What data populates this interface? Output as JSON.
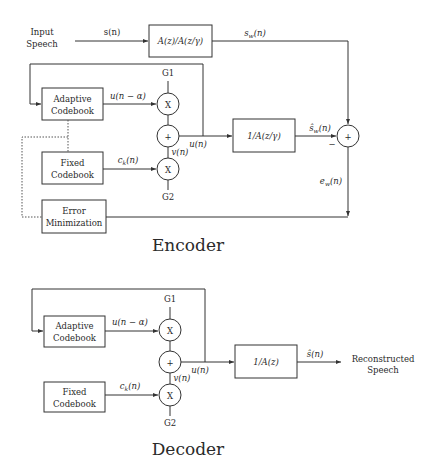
{
  "encoder": {
    "title": "Encoder",
    "input_label_line1": "Input",
    "input_label_line2": "Speech",
    "signal_s": "s(n)",
    "weighting_filter": "A(z)/A(z/γ)",
    "signal_sw": "s_w(n)",
    "adaptive_codebook_line1": "Adaptive",
    "adaptive_codebook_line2": "Codebook",
    "fixed_codebook_line1": "Fixed",
    "fixed_codebook_line2": "Codebook",
    "error_min_line1": "Error",
    "error_min_line2": "Minimization",
    "signal_u_alpha": "u(n − α)",
    "signal_ck": "c_k(n)",
    "signal_u": "u(n)",
    "signal_v": "v(n)",
    "gain1": "G1",
    "gain2": "G2",
    "multiply_symbol": "X",
    "add_symbol": "+",
    "synthesis_filter": "1/A(z/γ)",
    "signal_sw_hat": "ŝ_w(n)",
    "minus_sign": "−",
    "signal_ew": "e_w(n)"
  },
  "decoder": {
    "title": "Decoder",
    "adaptive_codebook_line1": "Adaptive",
    "adaptive_codebook_line2": "Codebook",
    "fixed_codebook_line1": "Fixed",
    "fixed_codebook_line2": "Codebook",
    "signal_u_alpha": "u(n − α)",
    "signal_ck": "c_k(n)",
    "signal_u": "u(n)",
    "signal_v": "v(n)",
    "gain1": "G1",
    "gain2": "G2",
    "multiply_symbol": "X",
    "add_symbol": "+",
    "synthesis_filter": "1/A(z)",
    "signal_s_hat": "ŝ(n)",
    "output_label_line1": "Reconstructed",
    "output_label_line2": "Speech"
  },
  "colors": {
    "ink": "#2a2a2a",
    "background": "#ffffff"
  }
}
